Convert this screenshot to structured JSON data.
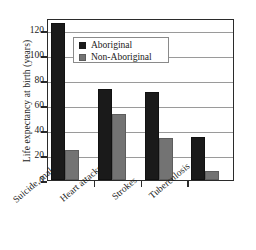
{
  "chart_data": {
    "type": "bar",
    "title": "",
    "xlabel": "",
    "ylabel": "Life expectancy at birth (years)",
    "categories": [
      "Suicide, male",
      "Heart attacks",
      "Strokes",
      "Tuberculosis"
    ],
    "series": [
      {
        "name": "Aboriginal",
        "color": "#1a1a1a",
        "values": [
          126,
          73,
          71,
          34.5
        ]
      },
      {
        "name": "Non-Aboriginal",
        "color": "#737373",
        "values": [
          24,
          53,
          34,
          7
        ]
      }
    ],
    "ylim": [
      0,
      130
    ],
    "yticks": [
      0,
      20,
      40,
      60,
      80,
      100,
      120
    ],
    "ytick_labels": [
      "0",
      "20",
      "40",
      "60",
      "80",
      "100",
      "120"
    ],
    "grid": "horizontal",
    "legend_position": "upper-center-left",
    "legend_entries": [
      "Aboriginal",
      "Non-Aboriginal"
    ],
    "xlabel_rotation": -40
  }
}
